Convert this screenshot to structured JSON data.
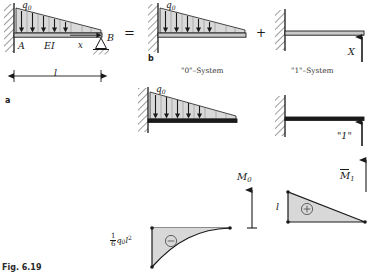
{
  "figure": {
    "caption": "Fig. 6.19",
    "panels": {
      "a": "a",
      "b": "b"
    }
  },
  "operators": {
    "equals": "=",
    "plus": "+"
  },
  "system_a": {
    "load_label": "q",
    "load_sub": "0",
    "node_left": "A",
    "node_right": "B",
    "stiffness": "EI",
    "coordinate": "x",
    "span_label": "l",
    "support_left": "fixed-wall-hatched",
    "support_right": "pin-roller-triangle"
  },
  "system_0": {
    "name": "\"0\"–System",
    "load_label": "q",
    "load_sub": "0",
    "support_left": "fixed-wall-hatched"
  },
  "system_1": {
    "name": "\"1\"–System",
    "force_label": "X",
    "unit_force_label": "\"1\"",
    "support_left": "fixed-wall-hatched"
  },
  "moment_diagram_0": {
    "title": "M",
    "title_sub": "0",
    "value_numerator": "1",
    "value_denominator": "6",
    "value_rest": "q",
    "value_rest_sub": "0",
    "value_rest_tail": "l",
    "value_exp": "2",
    "sign": "⊖",
    "sign_name": "minus-circle"
  },
  "moment_diagram_1": {
    "title": "M̅1",
    "title_main": "M",
    "title_sub": "1",
    "ordinate_label": "l",
    "sign": "⊕",
    "sign_name": "plus-circle"
  },
  "colors": {
    "line": "#1a1a1a",
    "load_fill": "#d9d9d9",
    "beam_fill": "#c9c9c9",
    "hatch": "#555555",
    "diagram_fill": "#d8d8d8"
  }
}
